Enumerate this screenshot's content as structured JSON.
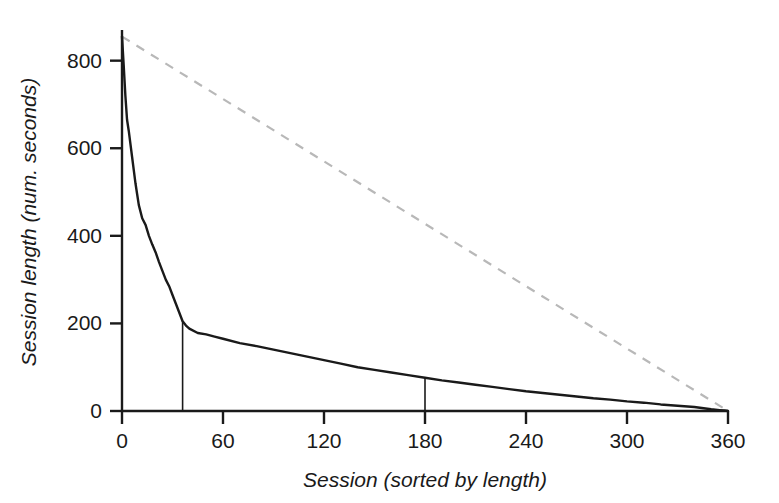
{
  "chart_data": {
    "type": "line",
    "title": "",
    "xlabel": "Session (sorted by length)",
    "ylabel": "Session length (num. seconds)",
    "xlim": [
      0,
      360
    ],
    "ylim": [
      0,
      870
    ],
    "xticks": [
      0,
      60,
      120,
      180,
      240,
      300,
      360
    ],
    "xtick_labels": [
      "0",
      "60",
      "120",
      "180",
      "240",
      "300",
      "360"
    ],
    "yticks": [
      0,
      200,
      400,
      600,
      800
    ],
    "ytick_labels": [
      "0",
      "200",
      "400",
      "600",
      "800"
    ],
    "grid": false,
    "legend": "none",
    "series": [
      {
        "name": "Session length (sorted, descending)",
        "style": "solid",
        "color": "#1a1a1a",
        "x": [
          0,
          1,
          2,
          3,
          4,
          5,
          6,
          7,
          8,
          9,
          10,
          12,
          14,
          16,
          18,
          20,
          22,
          24,
          26,
          28,
          30,
          32,
          34,
          36,
          38,
          40,
          45,
          50,
          55,
          60,
          70,
          80,
          90,
          100,
          110,
          120,
          130,
          140,
          150,
          160,
          170,
          180,
          190,
          200,
          210,
          220,
          230,
          240,
          250,
          260,
          270,
          280,
          290,
          300,
          310,
          320,
          330,
          340,
          350,
          355,
          358,
          360
        ],
        "y": [
          855,
          790,
          720,
          665,
          640,
          610,
          580,
          550,
          520,
          495,
          470,
          440,
          425,
          400,
          380,
          362,
          340,
          320,
          300,
          285,
          265,
          245,
          225,
          205,
          195,
          188,
          178,
          175,
          170,
          165,
          155,
          148,
          140,
          132,
          124,
          116,
          108,
          100,
          94,
          88,
          82,
          76,
          70,
          65,
          60,
          55,
          50,
          45,
          41,
          37,
          33,
          29,
          26,
          22,
          19,
          15,
          12,
          9,
          4,
          2,
          1,
          0
        ]
      },
      {
        "name": "Uniform reference (diagonal)",
        "style": "dashed",
        "color": "#b8b8b8",
        "x": [
          0,
          360
        ],
        "y": [
          855,
          0
        ]
      }
    ],
    "annotations": [
      {
        "name": "drop-line-36",
        "type": "vertical-line",
        "x": 36,
        "y_from": 0,
        "y_to": 205,
        "color": "#1a1a1a"
      },
      {
        "name": "drop-line-180",
        "type": "vertical-line",
        "x": 180,
        "y_from": 0,
        "y_to": 76,
        "color": "#1a1a1a"
      }
    ]
  },
  "axes": {
    "x_title": "Session (sorted by length)",
    "y_title": "Session length (num. seconds)",
    "x_tick_labels": [
      "0",
      "60",
      "120",
      "180",
      "240",
      "300",
      "360"
    ],
    "y_tick_labels": [
      "0",
      "200",
      "400",
      "600",
      "800"
    ]
  },
  "colors": {
    "background": "#ffffff",
    "axis": "#1a1a1a",
    "curve": "#1a1a1a",
    "reference_dashed": "#b8b8b8",
    "text": "#1a1a1a"
  }
}
